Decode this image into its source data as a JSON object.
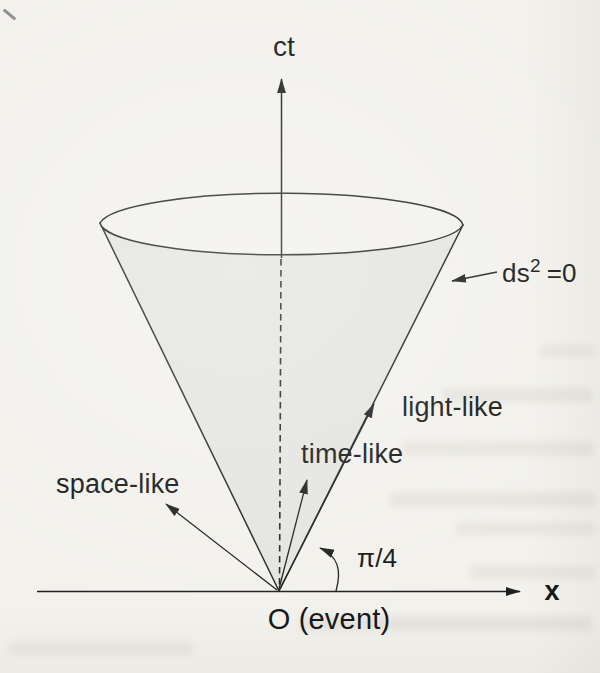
{
  "figure": {
    "type": "light-cone spacetime diagram",
    "colors": {
      "paper": "#f2f1ec",
      "ink": "#1f1f1f",
      "cone_fill": "#e4e4e1"
    },
    "labels": {
      "time_axis": "ct",
      "space_axis": "x",
      "origin": "O (event)",
      "interval_base": "ds",
      "interval_sup": "2",
      "interval_eq": "=0",
      "light_like": "light-like",
      "time_like": "time-like",
      "space_like": "space-like",
      "angle": "π/4"
    }
  }
}
